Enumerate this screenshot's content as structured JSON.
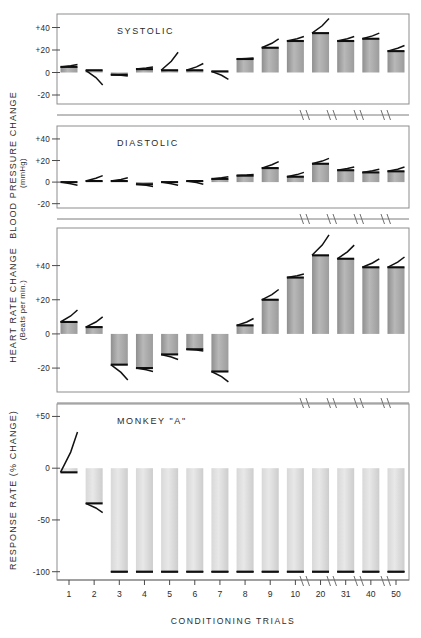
{
  "figure": {
    "subject_label": "MONKEY \"A\"",
    "xaxis_title": "CONDITIONING TRIALS",
    "x_tick_labels": [
      "1",
      "2",
      "3",
      "4",
      "5",
      "6",
      "7",
      "8",
      "9",
      "10",
      "20",
      "31",
      "40",
      "50"
    ],
    "axis_break_marks": 4
  },
  "axes": {
    "blood_pressure": {
      "title": "BLOOD PRESSURE CHANGE",
      "units": "(mmHg)"
    },
    "heart_rate": {
      "title": "HEART RATE CHANGE",
      "units": "(Beats per min.)"
    },
    "response_rate": {
      "title": "RESPONSE RATE (% CHANGE)",
      "units": ""
    }
  },
  "chart_data": {
    "type": "bar",
    "title": "MONKEY \"A\"",
    "xlabel": "CONDITIONING TRIALS",
    "categories": [
      "1",
      "2",
      "3",
      "4",
      "5",
      "6",
      "7",
      "8",
      "9",
      "10",
      "20",
      "31",
      "40",
      "50"
    ],
    "panels": [
      {
        "name": "systolic",
        "label": "SYSTOLIC",
        "ylabel": "BLOOD PRESSURE CHANGE (mmHg)",
        "ytick_labels": [
          "+40",
          "+20",
          "0",
          "-20"
        ],
        "ytick_values": [
          40,
          20,
          0,
          -20
        ],
        "ylim": [
          -28,
          52
        ],
        "values": [
          5,
          2,
          -2,
          3,
          2,
          2,
          1,
          12,
          22,
          28,
          35,
          28,
          30,
          19
        ],
        "trace_end_values": [
          7,
          -11,
          -3,
          5,
          18,
          8,
          -6,
          13,
          30,
          32,
          48,
          32,
          35,
          24
        ]
      },
      {
        "name": "diastolic",
        "label": "DIASTOLIC",
        "ylabel": "BLOOD PRESSURE CHANGE (mmHg)",
        "ytick_labels": [
          "+40",
          "+20",
          "0",
          "-20"
        ],
        "ytick_values": [
          40,
          20,
          0,
          -20
        ],
        "ylim": [
          -24,
          52
        ],
        "values": [
          0,
          1,
          1,
          -2,
          0,
          1,
          3,
          6,
          13,
          5,
          17,
          11,
          9,
          10
        ],
        "trace_end_values": [
          -3,
          6,
          4,
          -4,
          -3,
          -2,
          5,
          7,
          19,
          9,
          22,
          14,
          12,
          14
        ]
      },
      {
        "name": "heart_rate",
        "label": "",
        "ylabel": "HEART RATE CHANGE (Beats per min.)",
        "ytick_labels": [
          "+40",
          "+20",
          "0",
          "-20"
        ],
        "ytick_values": [
          40,
          20,
          0,
          -20
        ],
        "ylim": [
          -34,
          62
        ],
        "values": [
          7,
          4,
          -18,
          -20,
          -12,
          -9,
          -22,
          5,
          20,
          33,
          46,
          44,
          39,
          39
        ],
        "trace_end_values": [
          14,
          10,
          -27,
          -22,
          -15,
          -10,
          -28,
          9,
          26,
          35,
          58,
          52,
          44,
          45
        ]
      },
      {
        "name": "response_rate",
        "label": "MONKEY \"A\"",
        "ylabel": "RESPONSE RATE (% CHANGE)",
        "ytick_labels": [
          "+50",
          "0",
          "-50",
          "-100"
        ],
        "ytick_values": [
          50,
          0,
          -50,
          -100
        ],
        "ylim": [
          -108,
          62
        ],
        "values": [
          -4,
          -34,
          -100,
          -100,
          -100,
          -100,
          -100,
          -100,
          -100,
          -100,
          -100,
          -100,
          -100,
          -100
        ],
        "trace_end_values": [
          35,
          -43,
          -100,
          -100,
          -100,
          -100,
          -100,
          -100,
          -100,
          -100,
          -100,
          -100,
          -100,
          -100
        ]
      }
    ]
  }
}
